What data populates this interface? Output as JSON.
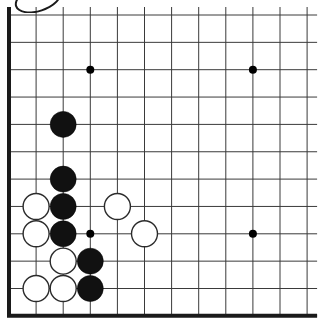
{
  "app": {
    "title": "Go Board Diagram",
    "description": "Go (Weiqi/Baduk) board corner position diagram showing the lower-left corner of a board with black and white stones"
  },
  "board": {
    "width_px": 323,
    "height_px": 329,
    "columns": 12,
    "rows": 12,
    "origin_x": 9,
    "origin_y": 15,
    "spacing_x": 27.1,
    "spacing_y": 27.35,
    "line_color": "#3a3a3a",
    "thin_line_width": 1,
    "edge_line_color": "#1a1a1a",
    "edge_line_width": 4,
    "background_color": "#ffffff",
    "edges": {
      "left_thick": true,
      "bottom_thick": true,
      "top_thick": false,
      "right_thick": false
    }
  },
  "star_points": {
    "label": "hoshi",
    "radius": 4,
    "color": "#000000",
    "points": [
      {
        "col": 3,
        "row": 2
      },
      {
        "col": 9,
        "row": 2
      },
      {
        "col": 3,
        "row": 8
      },
      {
        "col": 9,
        "row": 8
      }
    ]
  },
  "stones": {
    "radius": 13,
    "black_fill": "#111111",
    "black_stroke": "#000000",
    "white_fill": "#ffffff",
    "white_stroke": "#2b2b2b",
    "white_stroke_width": 1.4,
    "black_count": 6,
    "white_count": 7,
    "black": [
      {
        "col": 2,
        "row": 4,
        "label": "black-stone-c2-r4"
      },
      {
        "col": 2,
        "row": 6,
        "label": "black-stone-c2-r6"
      },
      {
        "col": 2,
        "row": 7,
        "label": "black-stone-c2-r7"
      },
      {
        "col": 2,
        "row": 8,
        "label": "black-stone-c2-r8"
      },
      {
        "col": 3,
        "row": 9,
        "label": "black-stone-c3-r9"
      },
      {
        "col": 3,
        "row": 10,
        "label": "black-stone-c3-r10"
      }
    ],
    "white": [
      {
        "col": 1,
        "row": 7,
        "label": "white-stone-c1-r7"
      },
      {
        "col": 1,
        "row": 8,
        "label": "white-stone-c1-r8"
      },
      {
        "col": 4,
        "row": 7,
        "label": "white-stone-c4-r7"
      },
      {
        "col": 5,
        "row": 8,
        "label": "white-stone-c5-r8"
      },
      {
        "col": 2,
        "row": 9,
        "label": "white-stone-c2-r9"
      },
      {
        "col": 1,
        "row": 10,
        "label": "white-stone-c1-r10"
      },
      {
        "col": 2,
        "row": 10,
        "label": "white-stone-c2-r10"
      }
    ]
  },
  "annotations": {
    "corner_mark": "scan-artifact-arc"
  }
}
